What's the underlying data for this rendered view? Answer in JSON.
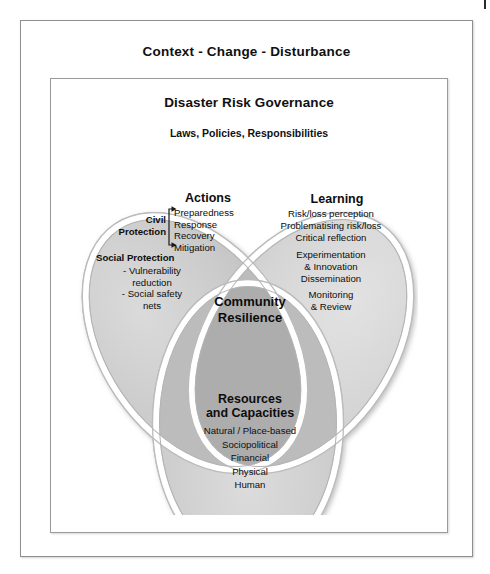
{
  "figure": {
    "context_title": "Context - Change - Disturbance",
    "governance_title": "Disaster Risk Governance",
    "governance_subtitle": "Laws, Policies, Responsibilities",
    "center_label_line1": "Community",
    "center_label_line2": "Resilience"
  },
  "lobes": {
    "actions": {
      "heading": "Actions",
      "civil_protection_line1": "Civil",
      "civil_protection_line2": "Protection",
      "civil_protection_items": [
        "Preparedness",
        "Response",
        "Recovery",
        "Mitigation"
      ],
      "social_protection_heading": "Social Protection",
      "social_protection_items": [
        "- Vulnerability",
        "reduction",
        "- Social safety",
        "nets"
      ]
    },
    "learning": {
      "heading": "Learning",
      "items": [
        "Risk/loss perception",
        "Problematising risk/loss",
        "Critical reflection",
        "Experimentation",
        "& Innovation",
        "Dissemination",
        "Monitoring",
        "& Review"
      ]
    },
    "resources": {
      "heading_line1": "Resources",
      "heading_line2": "and Capacities",
      "items": [
        "Natural / Place-based",
        "Sociopolitical",
        "Financial",
        "Physical",
        "Human"
      ]
    }
  },
  "colors": {
    "lobe_fill": "#c9c9c9",
    "lobe_fill_light": "#d6d6d6",
    "center_fill": "#adadad",
    "lobe_stroke": "#ffffff",
    "lobe_outline": "#b5b5b5",
    "frame_border": "#8e8e8e",
    "text": "#0d0d0d",
    "background": "#ffffff"
  }
}
